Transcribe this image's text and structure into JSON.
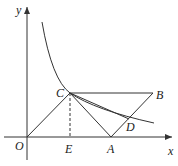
{
  "diagram": {
    "labels": {
      "y": "y",
      "x": "x",
      "O": "O",
      "C": "C",
      "B": "B",
      "D": "D",
      "E": "E",
      "A": "A"
    },
    "colors": {
      "stroke": "#333333",
      "background": "#ffffff"
    }
  }
}
